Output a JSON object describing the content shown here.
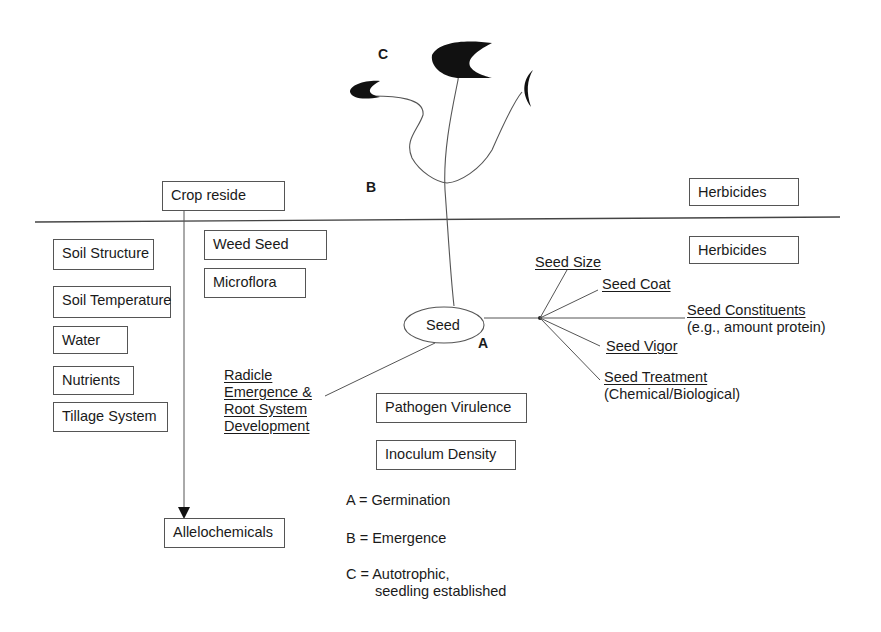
{
  "diagram": {
    "surface_factors": {
      "crop_residue": "Crop reside",
      "herbicides_above": "Herbicides"
    },
    "soil_factors": [
      "Soil Structure",
      "Soil Temperature",
      "Water",
      "Nutrients",
      "Tillage System"
    ],
    "biotic_factors": {
      "weed_seed": "Weed Seed",
      "microflora": "Microflora",
      "allelochemicals": "Allelochemicals",
      "herbicides_below": "Herbicides",
      "pathogen_virulence": "Pathogen Virulence",
      "inoculum_density": "Inoculum Density"
    },
    "seed": {
      "label": "Seed",
      "attributes": [
        {
          "label": "Seed Size",
          "note": ""
        },
        {
          "label": "Seed Coat",
          "note": ""
        },
        {
          "label": "Seed Constituents",
          "note": "(e.g., amount protein)"
        },
        {
          "label": "Seed Vigor",
          "note": ""
        },
        {
          "label": "Seed Treatment",
          "note": "(Chemical/Biological)"
        }
      ]
    },
    "radicle": {
      "lines": [
        "Radicle",
        "Emergence &",
        "Root System",
        "Development"
      ]
    },
    "stage_markers": {
      "A": "A",
      "B": "B",
      "C": "C"
    },
    "legend": [
      {
        "key": "A",
        "text": "A = Germination"
      },
      {
        "key": "B",
        "text": "B = Emergence"
      },
      {
        "key": "C",
        "text": "C = Autotrophic,",
        "text2": "seedling established"
      }
    ],
    "colors": {
      "ink": "#1a1a1a",
      "line": "#555555",
      "background": "#ffffff"
    }
  }
}
